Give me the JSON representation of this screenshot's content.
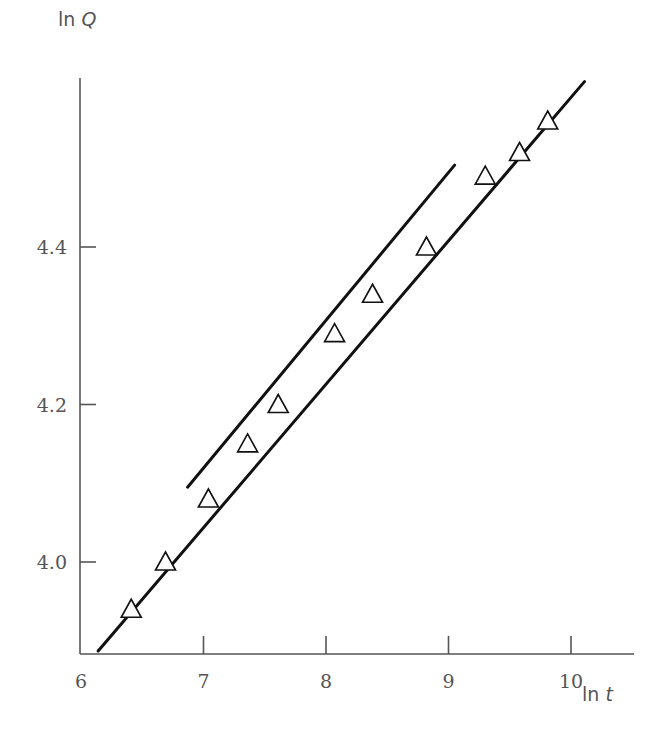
{
  "chart_data": {
    "type": "scatter",
    "title": "",
    "xlabel": "ln t",
    "ylabel": "ln Q",
    "xlim": [
      6,
      10.5
    ],
    "ylim": [
      3.885,
      4.62
    ],
    "grid": false,
    "legend": null,
    "x_ticks": [
      6,
      7,
      8,
      9,
      10
    ],
    "x_tick_labels": [
      "6",
      "7",
      "8",
      "9",
      "10"
    ],
    "y_ticks": [
      4.0,
      4.2,
      4.4
    ],
    "y_tick_labels": [
      "4.0",
      "4.2",
      "4.4"
    ],
    "series": [
      {
        "name": "data points",
        "marker": "open-triangle",
        "x": [
          6.41,
          6.69,
          7.04,
          7.36,
          7.61,
          8.07,
          8.38,
          8.82,
          9.3,
          9.58,
          9.81
        ],
        "y": [
          3.94,
          4.0,
          4.08,
          4.15,
          4.2,
          4.29,
          4.34,
          4.4,
          4.49,
          4.52,
          4.56
        ]
      },
      {
        "name": "fitted line (full range)",
        "style": "solid-line",
        "x": [
          6.14,
          10.11
        ],
        "y": [
          3.887,
          4.61
        ]
      },
      {
        "name": "tangent line (steeper)",
        "style": "solid-line",
        "x": [
          6.87,
          9.05
        ],
        "y": [
          4.095,
          4.504
        ]
      }
    ]
  },
  "colors": {
    "line": "#111111",
    "axis": "#555555",
    "text": "#555555",
    "marker_fill": "#ffffff",
    "background": "#ffffff"
  }
}
